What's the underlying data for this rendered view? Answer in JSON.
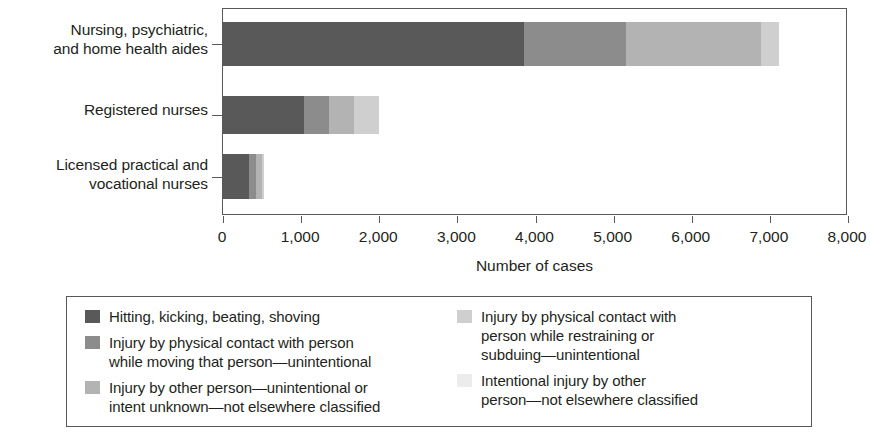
{
  "chart_data": {
    "type": "bar",
    "orientation": "horizontal",
    "stacked": true,
    "title": "",
    "xlabel": "Number of cases",
    "ylabel": "",
    "xlim": [
      0,
      8000
    ],
    "grid": false,
    "legend_position": "bottom",
    "categories": [
      "Nursing, psychiatric, and home health aides",
      "Registered nurses",
      "Licensed practical and vocational nurses"
    ],
    "category_lines": [
      [
        "Nursing, psychiatric,",
        "and home health aides"
      ],
      [
        "Registered nurses"
      ],
      [
        "Licensed practical and",
        "vocational nurses"
      ]
    ],
    "series": [
      {
        "name": "Hitting, kicking, beating, shoving",
        "color": "#595959",
        "values": [
          3850,
          1040,
          330
        ]
      },
      {
        "name": "Injury by physical contact with person while moving that person—unintentional",
        "color": "#8c8c8c",
        "values": [
          1310,
          320,
          90
        ]
      },
      {
        "name": "Injury by other person—unintentional or intent unknown—not elsewhere classified",
        "color": "#b3b3b3",
        "values": [
          1730,
          320,
          80
        ]
      },
      {
        "name": "Injury by physical contact with person while restraining or subduing—unintentional",
        "color": "#cfcfcf",
        "values": [
          230,
          320,
          30
        ]
      },
      {
        "name": "Intentional injury by other person—not elsewhere classified",
        "color": "#ececec",
        "values": [
          0,
          0,
          0
        ]
      }
    ],
    "totals": [
      7120,
      2000,
      530
    ],
    "xticks": [
      0,
      1000,
      2000,
      3000,
      4000,
      5000,
      6000,
      7000,
      8000
    ],
    "xtick_labels": [
      "0",
      "1,000",
      "2,000",
      "3,000",
      "4,000",
      "5,000",
      "6,000",
      "7,000",
      "8,000"
    ]
  },
  "legend": {
    "left_column": [
      {
        "swatch": "#595959",
        "lines": [
          "Hitting, kicking, beating, shoving"
        ]
      },
      {
        "swatch": "#8c8c8c",
        "lines": [
          "Injury by physical contact with person",
          "while moving that person—unintentional"
        ]
      },
      {
        "swatch": "#b3b3b3",
        "lines": [
          "Injury by other person—unintentional or",
          "intent unknown—not elsewhere classified"
        ]
      }
    ],
    "right_column": [
      {
        "swatch": "#cfcfcf",
        "lines": [
          "Injury by physical contact with",
          "person while restraining or",
          "subduing—unintentional"
        ]
      },
      {
        "swatch": "#ececec",
        "lines": [
          "Intentional injury by other",
          "person—not elsewhere classified"
        ]
      }
    ]
  },
  "axis": {
    "x_title": "Number of cases"
  }
}
